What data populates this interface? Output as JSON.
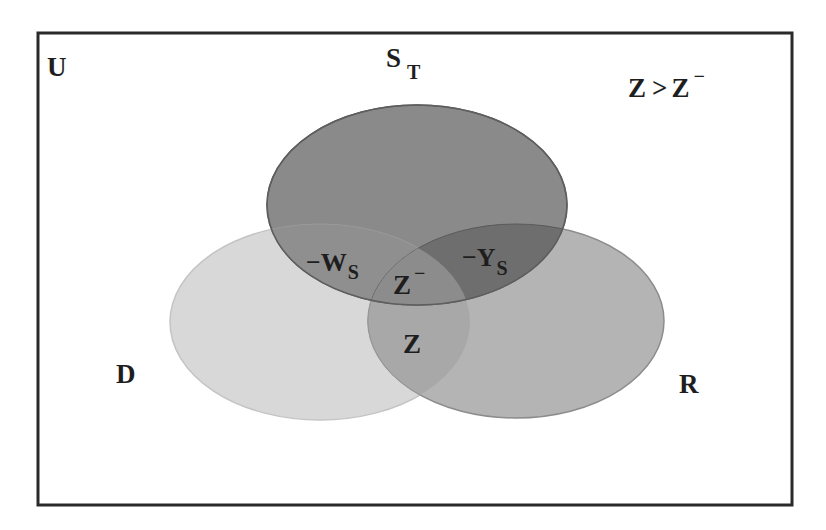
{
  "diagram": {
    "type": "venn",
    "universe_label": "U",
    "condition_label": {
      "lhs": "Z",
      "op": ">",
      "rhs": "Z",
      "rhs_sup": "−"
    },
    "sets": [
      {
        "id": "S_T",
        "label": "S",
        "label_sub": "T",
        "fill": "#8a8a8a",
        "cx": 417,
        "cy": 205,
        "rx": 150,
        "ry": 100
      },
      {
        "id": "D",
        "label": "D",
        "fill": "#d8d8d8",
        "cx": 320,
        "cy": 322,
        "rx": 150,
        "ry": 98
      },
      {
        "id": "R",
        "label": "R",
        "fill": "#b4b4b4",
        "cx": 516,
        "cy": 321,
        "rx": 148,
        "ry": 97
      }
    ],
    "regions": {
      "s_and_d": {
        "label": "−W",
        "sub": "S"
      },
      "s_and_r": {
        "label": "−Y",
        "sub": "S"
      },
      "all_three": {
        "label": "Z",
        "sup": "−"
      },
      "d_and_r": {
        "label": "Z"
      }
    },
    "colors": {
      "border": "#2a2a2a",
      "s_and_r_fill": "#6e6e6e",
      "s_and_d_fill": "#8f8f8f",
      "center_fill": "#8c8c8c",
      "d_and_r_fill": "#a8a8a8",
      "text": "#1e1e1e"
    }
  }
}
